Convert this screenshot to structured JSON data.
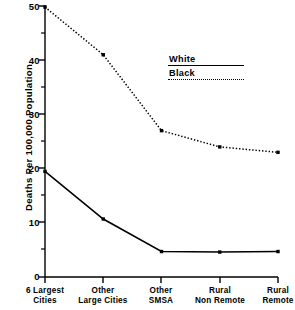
{
  "chart_data": {
    "type": "line",
    "title": "",
    "xlabel": "",
    "ylabel": "Deaths Per 100,000 Population",
    "categories": [
      "6 Largest Cities",
      "Other Large Cities",
      "Other SMSA",
      "Rural Non Remote",
      "Rural Remote"
    ],
    "category_lines": [
      {
        "l1": "6 Largest",
        "l2": "Cities"
      },
      {
        "l1": "Other",
        "l2": "Large Cities"
      },
      {
        "l1": "Other",
        "l2": "SMSA"
      },
      {
        "l1": "Rural",
        "l2": "Non Remote"
      },
      {
        "l1": "Rural",
        "l2": "Remote"
      }
    ],
    "series": [
      {
        "name": "White",
        "style": "solid",
        "color": "#000000",
        "values": [
          19.5,
          10.7,
          4.7,
          4.6,
          4.7
        ]
      },
      {
        "name": "Black",
        "style": "dotted",
        "color": "#000000",
        "values": [
          49.8,
          41.0,
          27.0,
          24.0,
          23.0
        ]
      }
    ],
    "ylim": [
      0,
      50
    ],
    "yticks": [
      0,
      10,
      20,
      30,
      40,
      50
    ],
    "ytick_labels": [
      "0",
      "10",
      "20",
      "30",
      "40",
      "50"
    ],
    "yminor_ticks": [
      5,
      15,
      25,
      35,
      45
    ],
    "grid": false,
    "legend_position": "upper-right-inside",
    "legend": [
      {
        "label": "White",
        "style": "solid"
      },
      {
        "label": "Black",
        "style": "dotted"
      }
    ]
  }
}
